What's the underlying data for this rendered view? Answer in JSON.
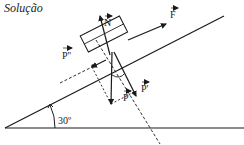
{
  "title": "Solução",
  "diagram": {
    "type": "free-body diagram on inclined plane",
    "angle_label": "30º",
    "forces": [
      {
        "id": "N",
        "label": "N",
        "description": "normal force, perpendicular to incline"
      },
      {
        "id": "F",
        "label": "F",
        "description": "applied force, parallel to incline, up the slope"
      },
      {
        "id": "P",
        "label": "P",
        "description": "weight, vertical downward"
      },
      {
        "id": "P1",
        "label": "P'",
        "description": "weight component perpendicular to incline"
      },
      {
        "id": "P2",
        "label": "P''",
        "description": "weight component parallel to incline, down the slope"
      }
    ],
    "colors": {
      "ink": "#1a1a1a",
      "background": "#ffffff"
    }
  }
}
